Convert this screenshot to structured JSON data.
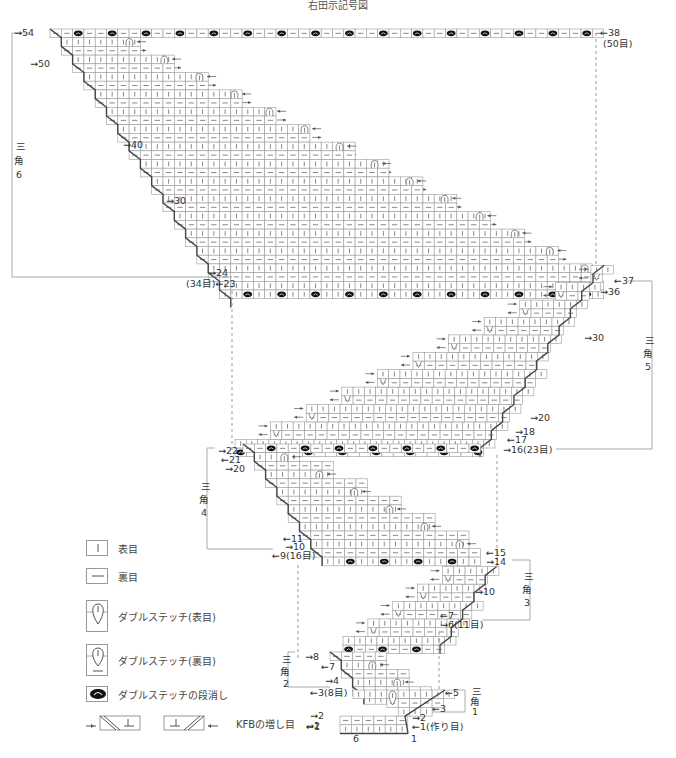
{
  "title": "右田示記号図",
  "colors": {
    "grid": "#9a9a9a",
    "line": "#555555",
    "edge": "#444444",
    "dashed": "#999999",
    "bobble": "#111111"
  },
  "sections": [
    {
      "id": "triangle-6",
      "label": [
        "三",
        "角",
        "6"
      ],
      "rows_label": [
        {
          "text": "→54",
          "side": "left"
        },
        {
          "text": "→50",
          "side": "left"
        },
        {
          "text": "→40",
          "side": "left"
        },
        {
          "text": "→30",
          "side": "left"
        },
        {
          "text": "→24",
          "side": "left"
        },
        {
          "text": "(34目)←23",
          "side": "left"
        },
        {
          "text": "←38",
          "side": "right"
        },
        {
          "text": "(50目)",
          "side": "right"
        }
      ]
    },
    {
      "id": "triangle-5",
      "label": [
        "三",
        "角",
        "5"
      ],
      "rows_label": [
        {
          "text": "←37"
        },
        {
          "text": "→36"
        },
        {
          "text": "→30"
        },
        {
          "text": "→20"
        },
        {
          "text": "→18"
        },
        {
          "text": "←17"
        },
        {
          "text": "→16(23目)"
        }
      ]
    },
    {
      "id": "triangle-4",
      "label": [
        "三",
        "角",
        "4"
      ],
      "rows_label": [
        {
          "text": "→22"
        },
        {
          "text": "←21"
        },
        {
          "text": "→20"
        },
        {
          "text": "←11"
        },
        {
          "text": "→10"
        },
        {
          "text": "←9(16目)"
        }
      ]
    },
    {
      "id": "triangle-3",
      "label": [
        "三",
        "角",
        "3"
      ],
      "rows_label": [
        {
          "text": "←15"
        },
        {
          "text": "→14"
        },
        {
          "text": "→10"
        },
        {
          "text": "←7"
        },
        {
          "text": "→6(11目)"
        }
      ]
    },
    {
      "id": "triangle-2",
      "label": [
        "三",
        "角",
        "2"
      ],
      "rows_label": [
        {
          "text": "→8"
        },
        {
          "text": "←7"
        },
        {
          "text": "→4"
        },
        {
          "text": "←3(8目)"
        }
      ]
    },
    {
      "id": "triangle-1",
      "label": [
        "三",
        "角",
        "1"
      ],
      "rows_label": [
        {
          "text": "←5"
        },
        {
          "text": "←3"
        },
        {
          "text": "→2"
        },
        {
          "text": "←1(作り目)"
        },
        {
          "text": "→2"
        },
        {
          "text": "←1"
        }
      ],
      "col_labels": [
        "6",
        "1"
      ]
    }
  ],
  "legend": {
    "items": [
      {
        "icon": "knit-stitch-icon",
        "label": "表目"
      },
      {
        "icon": "purl-stitch-icon",
        "label": "裏目"
      },
      {
        "icon": "double-stitch-knit-icon",
        "label": "ダブルステッチ(表目)"
      },
      {
        "icon": "double-stitch-purl-icon",
        "label": "ダブルステッチ(裏目)"
      },
      {
        "icon": "double-stitch-close-icon",
        "label": "ダブルステッチの段消し"
      },
      {
        "icon": "kfb-increase-icon",
        "label": "KFBの増し目"
      }
    ]
  }
}
